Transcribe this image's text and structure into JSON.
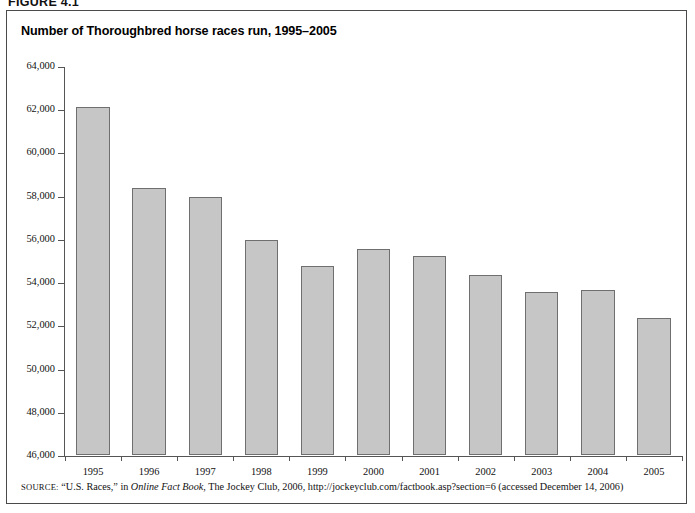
{
  "figure": {
    "label": "FIGURE 4.1",
    "title": "Number of Thoroughbred horse races run, 1995–2005"
  },
  "source": {
    "prefix": "SOURCE:",
    "part1": "“U.S. Races,” in ",
    "italic": "Online Fact Book",
    "part2": ", The Jockey Club, 2006, http://jockeyclub.com/factbook.asp?section=6 (accessed December 14, 2006)"
  },
  "style": {
    "bar_fill": "#c6c6c6",
    "bar_border": "#6f6f6f",
    "axis_color": "#555555",
    "frame_color": "#4a4a4a",
    "text_color": "#111111"
  },
  "chart_data": {
    "type": "bar",
    "title": "Number of Thoroughbred horse races run, 1995–2005",
    "xlabel": "",
    "ylabel": "",
    "categories": [
      "1995",
      "1996",
      "1997",
      "1998",
      "1999",
      "2000",
      "2001",
      "2002",
      "2003",
      "2004",
      "2005"
    ],
    "values": [
      62100,
      58350,
      57950,
      55950,
      54750,
      55550,
      55200,
      54350,
      53550,
      53650,
      52350
    ],
    "ylim": [
      46000,
      64000
    ],
    "ytick_step": 2000,
    "ytick_labels": [
      "64,000",
      "62,000",
      "60,000",
      "58,000",
      "56,000",
      "54,000",
      "52,000",
      "50,000",
      "48,000",
      "46,000"
    ],
    "ytick_values": [
      64000,
      62000,
      60000,
      58000,
      56000,
      54000,
      52000,
      50000,
      48000,
      46000
    ],
    "grid": false,
    "legend": false
  }
}
